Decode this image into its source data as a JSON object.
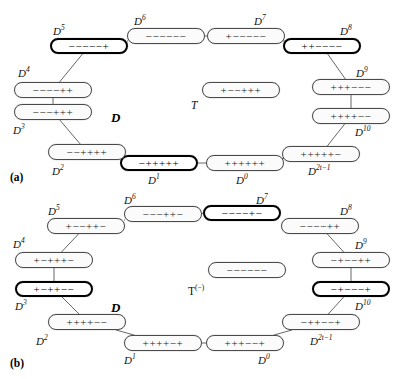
{
  "figure": {
    "title": "",
    "panels": [
      {
        "tag": "(a)",
        "tag_pos": {
          "x": 10,
          "y": 172
        },
        "center_label": "D",
        "center_label_pos": {
          "x": 111,
          "y": 110
        },
        "special_node": {
          "id": "T",
          "label": "T",
          "label_pos": {
            "x": 191,
            "y": 100
          },
          "seq": "+−−+++",
          "bold": false,
          "x": 202,
          "y": 82,
          "w": 78,
          "h": 16
        },
        "nodes": [
          {
            "id": "D0",
            "label": "D",
            "exp": "0",
            "seq": "++++++",
            "bold": false,
            "x": 206,
            "y": 155,
            "w": 78,
            "h": 16,
            "lx": 236,
            "ly": 175,
            "lpos": "below"
          },
          {
            "id": "D1",
            "label": "D",
            "exp": "1",
            "seq": "−+++++",
            "bold": true,
            "x": 120,
            "y": 155,
            "w": 78,
            "h": 16,
            "lx": 148,
            "ly": 175,
            "lpos": "below"
          },
          {
            "id": "D2",
            "label": "D",
            "exp": "2",
            "seq": "−−++++",
            "bold": false,
            "x": 48,
            "y": 144,
            "w": 78,
            "h": 16,
            "lx": 52,
            "ly": 166,
            "lpos": "below"
          },
          {
            "id": "D3",
            "label": "D",
            "exp": "3",
            "seq": "−−−+++",
            "bold": false,
            "x": 14,
            "y": 104,
            "w": 78,
            "h": 16,
            "lx": 13,
            "ly": 125,
            "lpos": "below"
          },
          {
            "id": "D4",
            "label": "D",
            "exp": "4",
            "seq": "−−−−++",
            "bold": false,
            "x": 14,
            "y": 82,
            "w": 78,
            "h": 16,
            "lx": 18,
            "ly": 68,
            "lpos": "above"
          },
          {
            "id": "D5",
            "label": "D",
            "exp": "5",
            "seq": "−−−−−+",
            "bold": true,
            "x": 50,
            "y": 38,
            "w": 78,
            "h": 16,
            "lx": 53,
            "ly": 26,
            "lpos": "above"
          },
          {
            "id": "D6",
            "label": "D",
            "exp": "6",
            "seq": "−−−−−−",
            "bold": false,
            "x": 127,
            "y": 28,
            "w": 78,
            "h": 16,
            "lx": 134,
            "ly": 16,
            "lpos": "above"
          },
          {
            "id": "D7",
            "label": "D",
            "exp": "7",
            "seq": "+−−−−−",
            "bold": false,
            "x": 207,
            "y": 28,
            "w": 78,
            "h": 16,
            "lx": 254,
            "ly": 16,
            "lpos": "above"
          },
          {
            "id": "D8",
            "label": "D",
            "exp": "8",
            "seq": "++−−−−",
            "bold": true,
            "x": 283,
            "y": 38,
            "w": 78,
            "h": 16,
            "lx": 340,
            "ly": 26,
            "lpos": "above"
          },
          {
            "id": "D9",
            "label": "D",
            "exp": "9",
            "seq": "+++−−−",
            "bold": false,
            "x": 312,
            "y": 79,
            "w": 78,
            "h": 16,
            "lx": 356,
            "ly": 68,
            "lpos": "above"
          },
          {
            "id": "D10",
            "label": "D",
            "exp": "10",
            "seq": "++++−−",
            "bold": false,
            "x": 312,
            "y": 108,
            "w": 78,
            "h": 16,
            "lx": 355,
            "ly": 127,
            "lpos": "below"
          },
          {
            "id": "D2t",
            "label": "D",
            "exp": "2t−1",
            "seq": "+++++−",
            "bold": false,
            "x": 282,
            "y": 146,
            "w": 78,
            "h": 16,
            "lx": 308,
            "ly": 166,
            "lpos": "below"
          }
        ],
        "edges": [
          [
            "D0",
            "D1"
          ],
          [
            "D1",
            "D2"
          ],
          [
            "D2",
            "D3"
          ],
          [
            "D3",
            "D4"
          ],
          [
            "D4",
            "D5"
          ],
          [
            "D5",
            "D6"
          ],
          [
            "D6",
            "D7"
          ],
          [
            "D7",
            "D8"
          ],
          [
            "D8",
            "D9"
          ],
          [
            "D9",
            "D10"
          ],
          [
            "D10",
            "D2t"
          ],
          [
            "D2t",
            "D0"
          ]
        ]
      },
      {
        "tag": "(b)",
        "tag_pos": {
          "x": 10,
          "y": 168
        },
        "center_label": "D",
        "center_label_pos": {
          "x": 111,
          "y": 110
        },
        "special_node": {
          "id": "T",
          "label": "T",
          "sup": "(−)",
          "label_pos": {
            "x": 188,
            "y": 96
          },
          "seq": "−−−−−−",
          "bold": false,
          "x": 208,
          "y": 72,
          "w": 78,
          "h": 16
        },
        "nodes": [
          {
            "id": "D0",
            "label": "D",
            "exp": "0",
            "seq": "+++−−+",
            "bold": false,
            "x": 206,
            "y": 145,
            "w": 78,
            "h": 16,
            "lx": 258,
            "ly": 165,
            "lpos": "below"
          },
          {
            "id": "D1",
            "label": "D",
            "exp": "1",
            "seq": "++++−+",
            "bold": false,
            "x": 124,
            "y": 145,
            "w": 78,
            "h": 16,
            "lx": 124,
            "ly": 165,
            "lpos": "below"
          },
          {
            "id": "D2",
            "label": "D",
            "exp": "2",
            "seq": "++++−−",
            "bold": false,
            "x": 48,
            "y": 124,
            "w": 78,
            "h": 16,
            "lx": 36,
            "ly": 146,
            "lpos": "below"
          },
          {
            "id": "D3",
            "label": "D",
            "exp": "3",
            "seq": "+−++−−",
            "bold": true,
            "x": 15,
            "y": 91,
            "w": 78,
            "h": 16,
            "lx": 15,
            "ly": 111,
            "lpos": "below"
          },
          {
            "id": "D4",
            "label": "D",
            "exp": "4",
            "seq": "+−+++−",
            "bold": false,
            "x": 15,
            "y": 62,
            "w": 78,
            "h": 16,
            "lx": 13,
            "ly": 49,
            "lpos": "above"
          },
          {
            "id": "D5",
            "label": "D",
            "exp": "5",
            "seq": "+−−++−",
            "bold": false,
            "x": 47,
            "y": 28,
            "w": 78,
            "h": 16,
            "lx": 48,
            "ly": 16,
            "lpos": "above"
          },
          {
            "id": "D6",
            "label": "D",
            "exp": "6",
            "seq": "−−−++−",
            "bold": false,
            "x": 124,
            "y": 16,
            "w": 78,
            "h": 16,
            "lx": 124,
            "ly": 5,
            "lpos": "above"
          },
          {
            "id": "D7",
            "label": "D",
            "exp": "7",
            "seq": "−−−−+−",
            "bold": true,
            "x": 203,
            "y": 15,
            "w": 78,
            "h": 16,
            "lx": 256,
            "ly": 5,
            "lpos": "above"
          },
          {
            "id": "D8",
            "label": "D",
            "exp": "8",
            "seq": "−−−−++",
            "bold": false,
            "x": 281,
            "y": 28,
            "w": 78,
            "h": 16,
            "lx": 340,
            "ly": 16,
            "lpos": "above"
          },
          {
            "id": "D9",
            "label": "D",
            "exp": "9",
            "seq": "−+−−++",
            "bold": false,
            "x": 312,
            "y": 62,
            "w": 78,
            "h": 16,
            "lx": 355,
            "ly": 50,
            "lpos": "above"
          },
          {
            "id": "D10",
            "label": "D",
            "exp": "10",
            "seq": "−+−−−+",
            "bold": true,
            "x": 312,
            "y": 91,
            "w": 78,
            "h": 16,
            "lx": 355,
            "ly": 111,
            "lpos": "below"
          },
          {
            "id": "D2t",
            "label": "D",
            "exp": "2t−1",
            "seq": "−++−−+",
            "bold": false,
            "x": 282,
            "y": 124,
            "w": 78,
            "h": 16,
            "lx": 310,
            "ly": 146,
            "lpos": "below"
          }
        ],
        "edges": [
          [
            "D0",
            "D1"
          ],
          [
            "D1",
            "D2"
          ],
          [
            "D2",
            "D3"
          ],
          [
            "D3",
            "D4"
          ],
          [
            "D4",
            "D5"
          ],
          [
            "D5",
            "D6"
          ],
          [
            "D6",
            "D7"
          ],
          [
            "D7",
            "D8"
          ],
          [
            "D8",
            "D9"
          ],
          [
            "D9",
            "D10"
          ],
          [
            "D10",
            "D2t"
          ],
          [
            "D2t",
            "D0"
          ]
        ]
      }
    ],
    "colors": {
      "node_border": "#4a4a4a",
      "node_border_bold": "#000000",
      "node_fill": "#fbfbfb",
      "edge": "#555555",
      "text": "#111111",
      "background": "#ffffff"
    }
  }
}
